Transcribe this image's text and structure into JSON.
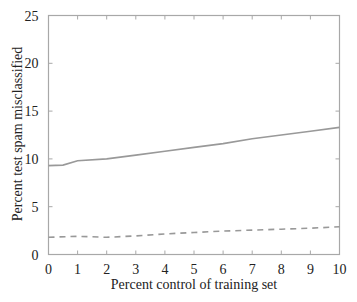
{
  "chart_data": {
    "type": "line",
    "title": "",
    "xlabel": "Percent control of training set",
    "ylabel": "Percent test spam misclassified",
    "xlim": [
      0,
      10
    ],
    "ylim": [
      0,
      25
    ],
    "xticks": [
      0,
      1,
      2,
      3,
      4,
      5,
      6,
      7,
      8,
      9,
      10
    ],
    "yticks": [
      0,
      5,
      10,
      15,
      20,
      25
    ],
    "grid": false,
    "legend": null,
    "series": [
      {
        "name": "solid",
        "style": "solid",
        "color": "#999999",
        "x": [
          0,
          0.5,
          1,
          2,
          3,
          4,
          5,
          6,
          7,
          8,
          9,
          10
        ],
        "values": [
          9.3,
          9.35,
          9.8,
          10.0,
          10.4,
          10.8,
          11.2,
          11.6,
          12.1,
          12.5,
          12.9,
          13.3
        ]
      },
      {
        "name": "dashed",
        "style": "dashed",
        "color": "#999999",
        "x": [
          0,
          1,
          2,
          3,
          4,
          5,
          6,
          7,
          8,
          9,
          10
        ],
        "values": [
          1.8,
          1.9,
          1.8,
          1.95,
          2.15,
          2.3,
          2.45,
          2.55,
          2.65,
          2.75,
          2.9
        ]
      }
    ]
  }
}
